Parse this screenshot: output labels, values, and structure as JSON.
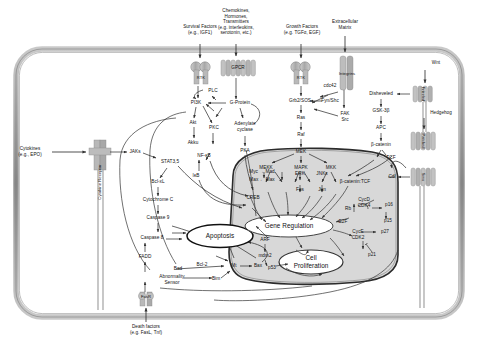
{
  "diagram": {
    "membrane_color": "#9a9a9a",
    "nucleus_fill": "#d8d8d8",
    "receptor_fill": "#b5b5b5",
    "line_color": "#333333"
  },
  "extracellular_ligands": [
    {
      "id": "survival",
      "label": "Survival Factors\n(e.g., IGF1)"
    },
    {
      "id": "chemokines",
      "label": "Chemokines,\nHormones,\nTransmitters\n(e.g. interleukins,\nserotonin, etc.)"
    },
    {
      "id": "growth",
      "label": "Growth Factors\n(e.g. TGFα, EGF)"
    },
    {
      "id": "ecm",
      "label": "Extracellular\nMatrix"
    },
    {
      "id": "wnt",
      "label": "Wnt"
    },
    {
      "id": "hedgehog",
      "label": "Hedgehog"
    },
    {
      "id": "cytokines",
      "label": "Cytokines\n(e.g., EPO)"
    },
    {
      "id": "death",
      "label": "Death factors\n(e.g. FasL, Tnf)"
    }
  ],
  "receptors": [
    {
      "id": "rtk-left",
      "label": "RTK"
    },
    {
      "id": "gpcr",
      "label": "GPCR"
    },
    {
      "id": "rtk-right",
      "label": "RTK"
    },
    {
      "id": "integrins",
      "label": "Integrins"
    },
    {
      "id": "frizzled",
      "label": "Frizzled"
    },
    {
      "id": "patched",
      "label": "Patched"
    },
    {
      "id": "smo",
      "label": "Smo"
    },
    {
      "id": "cytokine-receptor",
      "label": "Cytokine Receptor"
    },
    {
      "id": "fasr",
      "label": "FasR"
    }
  ],
  "cytoplasm_nodes": [
    {
      "id": "pi3k",
      "label": "PI3K"
    },
    {
      "id": "akt",
      "label": "Akt"
    },
    {
      "id": "akku",
      "label": "Akku"
    },
    {
      "id": "plc",
      "label": "PLC"
    },
    {
      "id": "pkc",
      "label": "PKC"
    },
    {
      "id": "nfkb",
      "label": "NF-κB"
    },
    {
      "id": "ikb",
      "label": "IκB"
    },
    {
      "id": "gprotein",
      "label": "G-Protein"
    },
    {
      "id": "adenylate",
      "label": "Adenylate\ncyclase"
    },
    {
      "id": "pka",
      "label": "PKA"
    },
    {
      "id": "grb2sos",
      "label": "Grb2/SOS"
    },
    {
      "id": "ras",
      "label": "Ras"
    },
    {
      "id": "raf",
      "label": "Raf"
    },
    {
      "id": "mek",
      "label": "MEK"
    },
    {
      "id": "mekk",
      "label": "MEKK"
    },
    {
      "id": "mapk",
      "label": "MAPK"
    },
    {
      "id": "mkk",
      "label": "MKK"
    },
    {
      "id": "cdc42",
      "label": "cdc42"
    },
    {
      "id": "fynshc",
      "label": "Fyn/Shc"
    },
    {
      "id": "faksrc",
      "label": "FAK\nSrc"
    },
    {
      "id": "disheveled",
      "label": "Disheveled"
    },
    {
      "id": "gsk3b",
      "label": "GSK-3β"
    },
    {
      "id": "apc",
      "label": "APC"
    },
    {
      "id": "bcatenin",
      "label": "β-catenin"
    },
    {
      "id": "tcf-cyto",
      "label": "TCF"
    },
    {
      "id": "jaks",
      "label": "JAKs"
    },
    {
      "id": "stat35",
      "label": "STAT3,5"
    },
    {
      "id": "bclxl",
      "label": "Bcl-xL"
    },
    {
      "id": "cytochromec",
      "label": "Cytochrome C"
    },
    {
      "id": "caspase9",
      "label": "Caspase 9"
    },
    {
      "id": "caspase8",
      "label": "Caspase 8"
    },
    {
      "id": "fadd",
      "label": "FADD"
    },
    {
      "id": "bcl2",
      "label": "Bcl-2"
    },
    {
      "id": "bad",
      "label": "Bad"
    },
    {
      "id": "abnormality",
      "label": "Abnormality\nSensor"
    },
    {
      "id": "bim",
      "label": "Bim"
    },
    {
      "id": "mt",
      "label": "Mt"
    },
    {
      "id": "bax",
      "label": "Bax"
    },
    {
      "id": "cdl",
      "label": "Cdl"
    }
  ],
  "nucleus_nodes": [
    {
      "id": "mycmad",
      "label": "Myc → Mad"
    },
    {
      "id": "maxmax",
      "label": "Max ← Max"
    },
    {
      "id": "creb",
      "label": "CREB"
    },
    {
      "id": "erk",
      "label": "ERK"
    },
    {
      "id": "fos",
      "label": "Fos"
    },
    {
      "id": "jnks",
      "label": "JNKs"
    },
    {
      "id": "jun",
      "label": "Jun"
    },
    {
      "id": "bcateninTcf",
      "label": "β-catenin:TCF"
    },
    {
      "id": "cycd-cdk4",
      "label": "CycD\nCDK4"
    },
    {
      "id": "rb",
      "label": "Rb"
    },
    {
      "id": "p16",
      "label": "p16"
    },
    {
      "id": "p15",
      "label": "p15"
    },
    {
      "id": "e2f",
      "label": "E2F"
    },
    {
      "id": "cyce-cdk2",
      "label": "CycE\nCDK2"
    },
    {
      "id": "p27",
      "label": "p27"
    },
    {
      "id": "p21",
      "label": "p21"
    },
    {
      "id": "arf",
      "label": "ARF"
    },
    {
      "id": "mdm2",
      "label": "mdm2"
    },
    {
      "id": "p53",
      "label": "p53"
    }
  ],
  "outcomes": [
    {
      "id": "apoptosis",
      "label": "Apoptosis"
    },
    {
      "id": "gene-regulation",
      "label": "Gene Regulation"
    },
    {
      "id": "cell-proliferation",
      "label": "Cell\nProliferation"
    }
  ]
}
